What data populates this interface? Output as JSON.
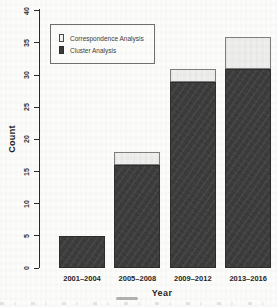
{
  "figure": {
    "background_color": "#fcfcfb",
    "kind": "scanned stacked bar chart"
  },
  "chart_data": {
    "type": "bar",
    "stacked": true,
    "title": "",
    "xlabel": "Year",
    "ylabel": "Count",
    "categories": [
      "2001–2004",
      "2005–2008",
      "2009–2012",
      "2013–2016"
    ],
    "series": [
      {
        "name": "Correspondence Analysis",
        "values": [
          0,
          2,
          2,
          5
        ],
        "color": "#efefee"
      },
      {
        "name": "Cluster Analysis",
        "values": [
          5,
          16,
          29,
          31
        ],
        "color": "#3d3d3d"
      }
    ],
    "totals": [
      5,
      18,
      31,
      36
    ],
    "ylim": [
      0,
      40
    ],
    "yticks": [
      0,
      5,
      10,
      15,
      20,
      25,
      30,
      35,
      40
    ],
    "grid": false,
    "legend_position": "top-left",
    "axis_color": "#2b2b2b"
  },
  "legend": {
    "items": [
      {
        "label": "Correspondence Analysis",
        "swatch": "light"
      },
      {
        "label": "Cluster Analysis",
        "swatch": "dark"
      }
    ]
  }
}
